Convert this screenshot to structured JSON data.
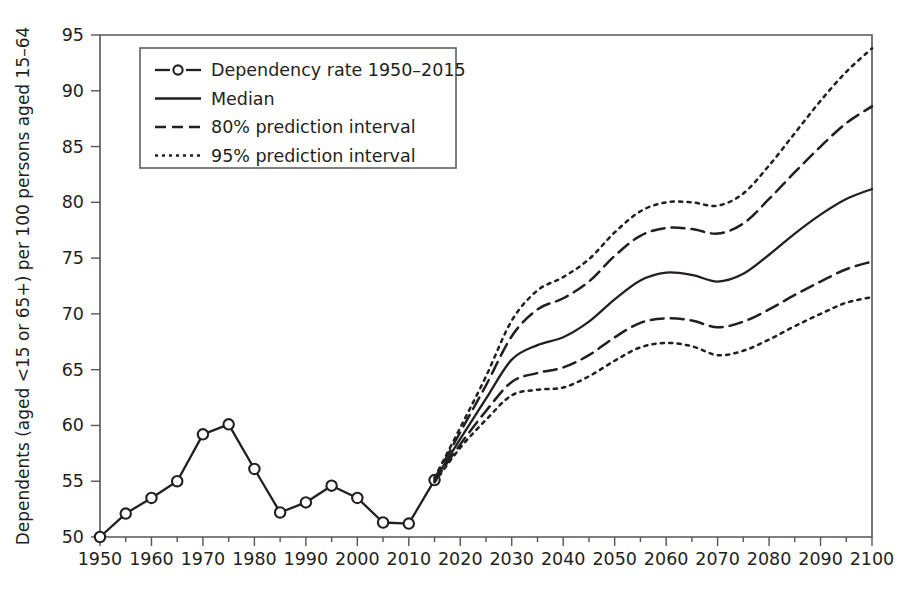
{
  "chart_data": {
    "type": "line",
    "title": "",
    "xlabel": "",
    "ylabel": "Dependents (aged <15 or 65+) per 100 persons aged 15–64",
    "xlim": [
      1950,
      2100
    ],
    "ylim": [
      50,
      95
    ],
    "x_ticks": [
      1950,
      1960,
      1970,
      1980,
      1990,
      2000,
      2010,
      2020,
      2030,
      2040,
      2050,
      2060,
      2070,
      2080,
      2090,
      2100
    ],
    "y_ticks": [
      50,
      55,
      60,
      65,
      70,
      75,
      80,
      85,
      90,
      95
    ],
    "x_minor_step": 5,
    "grid": false,
    "legend_position": "top-left",
    "line_color": "#231f20",
    "axis_color": "#53565a",
    "background_color": "#ffffff",
    "series": [
      {
        "name": "Dependency rate 1950–2015",
        "style": "solid-with-markers",
        "x": [
          1950,
          1955,
          1960,
          1965,
          1970,
          1975,
          1980,
          1985,
          1990,
          1995,
          2000,
          2005,
          2010,
          2015
        ],
        "values": [
          50.0,
          52.1,
          53.5,
          55.0,
          59.2,
          60.1,
          56.1,
          52.2,
          53.1,
          54.6,
          53.5,
          51.3,
          51.2,
          55.1
        ]
      },
      {
        "name": "Median",
        "style": "solid",
        "x": [
          2015,
          2020,
          2025,
          2030,
          2035,
          2040,
          2045,
          2050,
          2055,
          2060,
          2065,
          2070,
          2075,
          2080,
          2085,
          2090,
          2095,
          2100
        ],
        "values": [
          55.1,
          58.8,
          62.4,
          65.9,
          67.2,
          67.9,
          69.3,
          71.3,
          73.0,
          73.7,
          73.5,
          72.9,
          73.6,
          75.3,
          77.2,
          78.9,
          80.3,
          81.2
        ]
      },
      {
        "name": "80% prediction interval",
        "style": "dashed",
        "bounds": {
          "x": [
            2015,
            2020,
            2025,
            2030,
            2035,
            2040,
            2045,
            2050,
            2055,
            2060,
            2065,
            2070,
            2075,
            2080,
            2085,
            2090,
            2095,
            2100
          ],
          "upper": [
            55.2,
            59.4,
            63.6,
            68.0,
            70.4,
            71.4,
            72.9,
            75.2,
            77.0,
            77.7,
            77.6,
            77.2,
            78.1,
            80.3,
            82.7,
            85.0,
            87.1,
            88.6
          ],
          "lower": [
            55.0,
            58.3,
            61.3,
            63.9,
            64.7,
            65.2,
            66.3,
            67.9,
            69.2,
            69.6,
            69.4,
            68.8,
            69.3,
            70.4,
            71.7,
            72.9,
            74.0,
            74.7
          ]
        }
      },
      {
        "name": "95% prediction interval",
        "style": "dotted",
        "bounds": {
          "x": [
            2015,
            2020,
            2025,
            2030,
            2035,
            2040,
            2045,
            2050,
            2055,
            2060,
            2065,
            2070,
            2075,
            2080,
            2085,
            2090,
            2095,
            2100
          ],
          "upper": [
            55.3,
            59.8,
            64.4,
            69.4,
            72.1,
            73.3,
            74.9,
            77.3,
            79.2,
            80.0,
            80.0,
            79.7,
            80.8,
            83.3,
            86.2,
            89.1,
            91.7,
            93.8
          ],
          "lower": [
            54.9,
            58.0,
            60.5,
            62.7,
            63.2,
            63.4,
            64.4,
            65.8,
            67.0,
            67.4,
            67.1,
            66.3,
            66.7,
            67.7,
            68.9,
            70.0,
            71.0,
            71.5
          ]
        }
      }
    ],
    "legend": [
      {
        "label": "Dependency rate 1950–2015",
        "marker": "circle",
        "dash": "8 5"
      },
      {
        "label": "Median",
        "marker": "none",
        "dash": "none"
      },
      {
        "label": "80% prediction interval",
        "marker": "none",
        "dash": "11 6"
      },
      {
        "label": "95% prediction interval",
        "marker": "none",
        "dash": "3 4"
      }
    ]
  }
}
